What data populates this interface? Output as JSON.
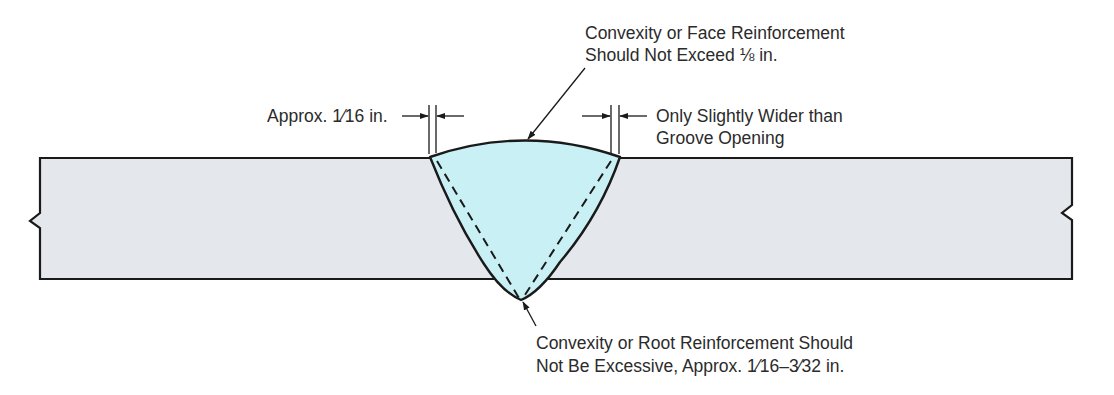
{
  "figure": {
    "colors": {
      "plate_fill": "#e4e8ec",
      "weld_fill": "#c9f0f5",
      "outline": "#1a1a1a",
      "text": "#2b2b2b"
    }
  },
  "annotations": {
    "face_reinforcement": {
      "line1": "Convexity or Face Reinforcement",
      "line2": "Should Not Exceed ⅛ in."
    },
    "toe_left": {
      "text": "Approx. 1⁄16 in."
    },
    "toe_right": {
      "line1": "Only Slightly Wider than",
      "line2": "Groove Opening"
    },
    "root_reinforcement": {
      "line1": "Convexity or Root Reinforcement Should",
      "line2": "Not Be Excessive, Approx. 1⁄16–3⁄32 in."
    }
  }
}
